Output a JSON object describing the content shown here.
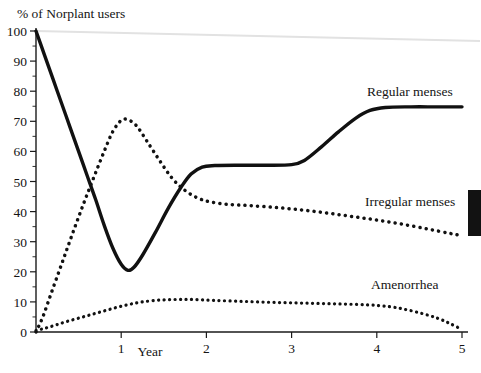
{
  "chart_data": {
    "type": "line",
    "title": "",
    "ylabel": "% of Norplant users",
    "xlabel": "Year",
    "xlim": [
      0,
      5
    ],
    "ylim": [
      0,
      100
    ],
    "ytick_step": 10,
    "yticks": [
      0,
      10,
      20,
      30,
      40,
      50,
      60,
      70,
      80,
      90,
      100
    ],
    "xticks": [
      1,
      2,
      3,
      4,
      5
    ],
    "xtick_labels": [
      "1",
      "2",
      "3",
      "4",
      "5"
    ],
    "minor_ticks": true,
    "grid": false,
    "legend_position": "inline-right",
    "series": [
      {
        "name": "Regular menses",
        "style": "solid",
        "points": [
          [
            0.0,
            100.0
          ],
          [
            0.1,
            92.0
          ],
          [
            0.2,
            84.0
          ],
          [
            0.3,
            76.0
          ],
          [
            0.4,
            68.0
          ],
          [
            0.5,
            60.0
          ],
          [
            0.6,
            52.0
          ],
          [
            0.7,
            44.0
          ],
          [
            0.8,
            35.5
          ],
          [
            0.9,
            28.0
          ],
          [
            1.0,
            22.5
          ],
          [
            1.08,
            20.5
          ],
          [
            1.15,
            21.5
          ],
          [
            1.25,
            25.5
          ],
          [
            1.4,
            33.0
          ],
          [
            1.55,
            41.0
          ],
          [
            1.7,
            48.0
          ],
          [
            1.82,
            52.5
          ],
          [
            1.95,
            54.8
          ],
          [
            2.1,
            55.3
          ],
          [
            2.4,
            55.4
          ],
          [
            2.7,
            55.4
          ],
          [
            3.0,
            55.6
          ],
          [
            3.15,
            57.0
          ],
          [
            3.35,
            61.5
          ],
          [
            3.55,
            66.5
          ],
          [
            3.75,
            71.0
          ],
          [
            3.92,
            73.6
          ],
          [
            4.1,
            74.6
          ],
          [
            4.4,
            74.8
          ],
          [
            4.7,
            74.8
          ],
          [
            5.0,
            74.8
          ]
        ]
      },
      {
        "name": "Irregular menses",
        "style": "dotted",
        "points": [
          [
            0.0,
            0.0
          ],
          [
            0.08,
            5.0
          ],
          [
            0.18,
            13.0
          ],
          [
            0.3,
            22.5
          ],
          [
            0.42,
            32.0
          ],
          [
            0.55,
            42.0
          ],
          [
            0.68,
            51.5
          ],
          [
            0.8,
            60.0
          ],
          [
            0.9,
            66.5
          ],
          [
            1.0,
            70.3
          ],
          [
            1.08,
            70.5
          ],
          [
            1.18,
            68.5
          ],
          [
            1.3,
            63.5
          ],
          [
            1.45,
            57.0
          ],
          [
            1.6,
            51.0
          ],
          [
            1.75,
            47.0
          ],
          [
            1.9,
            44.5
          ],
          [
            2.05,
            43.2
          ],
          [
            2.25,
            42.4
          ],
          [
            2.5,
            42.0
          ],
          [
            2.8,
            41.4
          ],
          [
            3.1,
            40.6
          ],
          [
            3.4,
            39.6
          ],
          [
            3.7,
            38.4
          ],
          [
            4.0,
            37.2
          ],
          [
            4.3,
            35.8
          ],
          [
            4.6,
            34.2
          ],
          [
            4.85,
            32.8
          ],
          [
            5.0,
            32.0
          ]
        ]
      },
      {
        "name": "Amenorrhea",
        "style": "dotted",
        "points": [
          [
            0.0,
            0.5
          ],
          [
            0.1,
            1.2
          ],
          [
            0.22,
            2.2
          ],
          [
            0.35,
            3.4
          ],
          [
            0.5,
            4.6
          ],
          [
            0.65,
            5.8
          ],
          [
            0.8,
            7.0
          ],
          [
            0.95,
            8.2
          ],
          [
            1.1,
            9.2
          ],
          [
            1.25,
            10.0
          ],
          [
            1.45,
            10.6
          ],
          [
            1.65,
            10.8
          ],
          [
            1.85,
            10.8
          ],
          [
            2.1,
            10.5
          ],
          [
            2.4,
            10.2
          ],
          [
            2.7,
            9.9
          ],
          [
            3.0,
            9.7
          ],
          [
            3.3,
            9.5
          ],
          [
            3.6,
            9.3
          ],
          [
            3.9,
            9.0
          ],
          [
            4.15,
            8.4
          ],
          [
            4.35,
            7.4
          ],
          [
            4.55,
            6.0
          ],
          [
            4.72,
            4.5
          ],
          [
            4.86,
            2.8
          ],
          [
            5.0,
            0.8
          ]
        ]
      }
    ]
  },
  "axes": {
    "y_title": "% of Norplant users",
    "x_title": "Year",
    "y_tick_labels": [
      "0",
      "10",
      "20",
      "30",
      "40",
      "50",
      "60",
      "70",
      "80",
      "90",
      "100"
    ],
    "x_tick_labels": [
      "1",
      "2",
      "3",
      "4",
      "5"
    ]
  },
  "labels": {
    "regular": "Regular menses",
    "irregular": "Irregular menses",
    "amenorrhea": "Amenorrhea"
  },
  "colors": {
    "ink": "#111111",
    "axis": "#1a1a1a",
    "scan_artifact": "#e2e2e2",
    "edge_block": "#121212",
    "background": "#ffffff"
  }
}
